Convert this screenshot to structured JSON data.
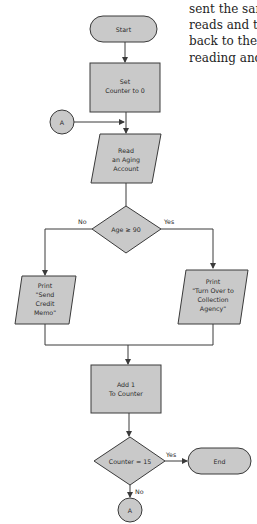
{
  "body_text": {
    "lines": [
      "sent the sam",
      "reads and th",
      "back to the r",
      "reading and"
    ]
  },
  "flowchart": {
    "colors": {
      "fill": "#c9c9c9",
      "stroke": "#3a3a3a",
      "text": "#2a2a2a"
    },
    "start": {
      "label": "Start"
    },
    "set_counter": {
      "line1": "Set",
      "line2": "Counter to 0"
    },
    "connector_in": {
      "label": "A"
    },
    "read_account": {
      "line1": "Read",
      "line2": "an Aging",
      "line3": "Account"
    },
    "age_decision": {
      "label": "Age ≥ 90",
      "no_label": "No",
      "yes_label": "Yes"
    },
    "print_memo": {
      "line1": "Print",
      "line2": "\"Send",
      "line3": "Credit",
      "line4": "Memo\""
    },
    "print_collection": {
      "line1": "Print",
      "line2": "\"Turn Over to",
      "line3": "Collection",
      "line4": "Agency\""
    },
    "add_counter": {
      "line1": "Add 1",
      "line2": "To Counter"
    },
    "counter_decision": {
      "label": "Counter = 15",
      "yes_label": "Yes",
      "no_label": "No"
    },
    "end": {
      "label": "End"
    },
    "connector_out": {
      "label": "A"
    }
  }
}
